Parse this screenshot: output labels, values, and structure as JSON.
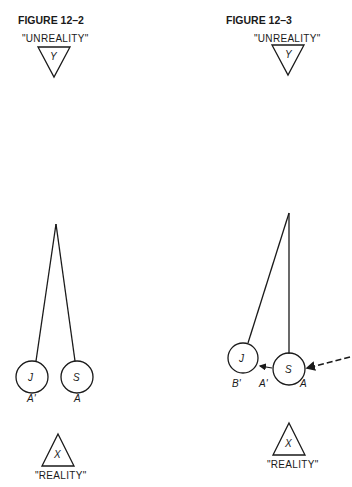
{
  "figures": [
    {
      "title": "FIGURE 12–2",
      "top_label": "\"UNREALITY\"",
      "top_symbol": "Y",
      "left_ball": "J",
      "right_ball": "S",
      "left_ball_label": "A'",
      "right_ball_label": "A",
      "bottom_symbol": "X",
      "bottom_label": "\"REALITY\""
    },
    {
      "title": "FIGURE 12–3",
      "top_label": "\"UNREALITY\"",
      "top_symbol": "Y",
      "left_ball": "J",
      "right_ball": "S",
      "left_ball_label": "B'",
      "middle_label": "A'",
      "right_ball_label": "A",
      "bottom_symbol": "X",
      "bottom_label": "\"REALITY\""
    }
  ],
  "colors": {
    "ink": "#1a1a1a",
    "background": "#ffffff"
  }
}
